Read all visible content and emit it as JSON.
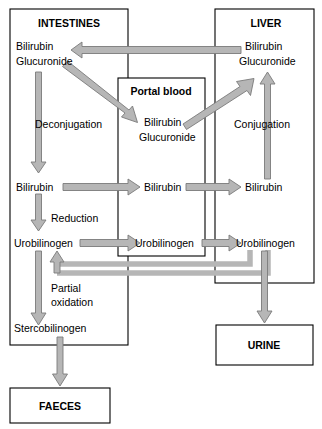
{
  "diagram": {
    "type": "flow-diagram",
    "canvas": {
      "width": 322,
      "height": 429
    },
    "colors": {
      "arrow_fill": "#b6b6b6",
      "arrow_outline": "#7a7a7a",
      "box_stroke": "#000000",
      "background": "#ffffff",
      "text": "#000000"
    }
  },
  "compartments": [
    {
      "id": "intestines",
      "label": "INTESTINES"
    },
    {
      "id": "liver",
      "label": "LIVER"
    },
    {
      "id": "portal_blood",
      "label": "Portal blood"
    }
  ],
  "terminals": [
    {
      "id": "urine",
      "label": "URINE"
    },
    {
      "id": "faeces",
      "label": "FAECES"
    }
  ],
  "species": {
    "intestines": {
      "bilirubin_glucuronide_line1": "Bilirubin",
      "bilirubin_glucuronide_line2": "Glucuronide",
      "bilirubin": "Bilirubin",
      "urobilinogen": "Urobilinogen",
      "stercobilinogen": "Stercobilinogen"
    },
    "portal_blood": {
      "bilirubin_glucuronide_line1": "Bilirubin",
      "bilirubin_glucuronide_line2": "Glucuronide",
      "bilirubin": "Bilirubin",
      "urobilinogen": "Urobilinogen"
    },
    "liver": {
      "bilirubin_glucuronide_line1": "Bilirubin",
      "bilirubin_glucuronide_line2": "Glucuronide",
      "bilirubin": "Bilirubin",
      "urobilinogen": "Urobilinogen"
    }
  },
  "processes": [
    {
      "id": "deconjugation",
      "label": "Deconjugation"
    },
    {
      "id": "conjugation",
      "label": "Conjugation"
    },
    {
      "id": "reduction",
      "label": "Reduction"
    },
    {
      "id": "partial_oxidation_line1",
      "label": "Partial"
    },
    {
      "id": "partial_oxidation_line2",
      "label": "oxidation"
    }
  ],
  "flows": [
    {
      "id": "liver-bg-to-intestines-bg",
      "from": "liver.bilirubin_glucuronide",
      "to": "intestines.bilirubin_glucuronide",
      "direction": "left"
    },
    {
      "id": "intestines-bg-to-portal-bg",
      "from": "intestines.bilirubin_glucuronide",
      "to": "portal_blood.bilirubin_glucuronide",
      "direction": "down-right"
    },
    {
      "id": "portal-bg-to-liver-bg",
      "from": "portal_blood.bilirubin_glucuronide",
      "to": "liver.bilirubin_glucuronide",
      "direction": "up-right"
    },
    {
      "id": "intestines-bg-to-bilirubin",
      "from": "intestines.bilirubin_glucuronide",
      "to": "intestines.bilirubin",
      "direction": "down",
      "process": "deconjugation"
    },
    {
      "id": "liver-bilirubin-to-bg",
      "from": "liver.bilirubin",
      "to": "liver.bilirubin_glucuronide",
      "direction": "up",
      "process": "conjugation"
    },
    {
      "id": "intestines-bilirubin-to-portal",
      "from": "intestines.bilirubin",
      "to": "portal_blood.bilirubin",
      "direction": "right"
    },
    {
      "id": "portal-bilirubin-to-liver",
      "from": "portal_blood.bilirubin",
      "to": "liver.bilirubin",
      "direction": "right"
    },
    {
      "id": "intestines-bilirubin-to-urobilinogen",
      "from": "intestines.bilirubin",
      "to": "intestines.urobilinogen",
      "direction": "down",
      "process": "reduction"
    },
    {
      "id": "intestines-uro-to-portal-uro",
      "from": "intestines.urobilinogen",
      "to": "portal_blood.urobilinogen",
      "direction": "right"
    },
    {
      "id": "portal-uro-to-liver-uro",
      "from": "portal_blood.urobilinogen",
      "to": "liver.urobilinogen",
      "direction": "right"
    },
    {
      "id": "liver-uro-recycle-to-intestines-uro",
      "from": "liver.urobilinogen",
      "to": "intestines.urobilinogen",
      "direction": "recycle-left-up"
    },
    {
      "id": "portal-uro-recycle",
      "from": "portal_blood.urobilinogen",
      "to": "intestines.urobilinogen",
      "direction": "recycle-left-up"
    },
    {
      "id": "intestines-uro-to-stercobilinogen",
      "from": "intestines.urobilinogen",
      "to": "intestines.stercobilinogen",
      "direction": "down",
      "process": "partial_oxidation"
    },
    {
      "id": "liver-uro-to-urine",
      "from": "liver.urobilinogen",
      "to": "urine",
      "direction": "down"
    },
    {
      "id": "stercobilinogen-to-faeces",
      "from": "intestines.stercobilinogen",
      "to": "faeces",
      "direction": "down"
    }
  ]
}
